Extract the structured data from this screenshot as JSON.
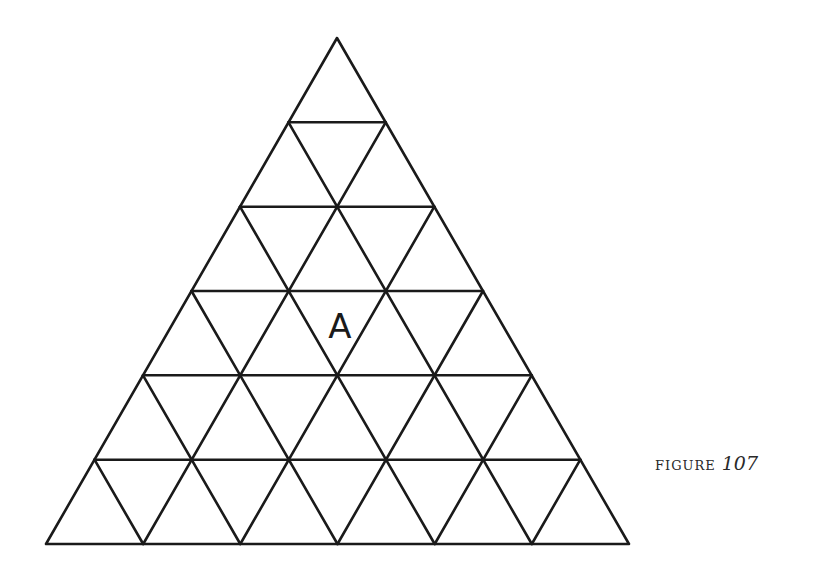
{
  "figure": {
    "type": "triangular-grid",
    "rows": 6,
    "apex": [
      337,
      38
    ],
    "base_left": [
      46,
      544
    ],
    "base_right": [
      629,
      544
    ],
    "line_color": "#1a1a1a",
    "labels": [
      {
        "text": "A",
        "row": 4,
        "position": "downward-triangle",
        "x": 340,
        "y": 338
      }
    ]
  },
  "caption": {
    "word": "FIGURE",
    "number": "107"
  }
}
